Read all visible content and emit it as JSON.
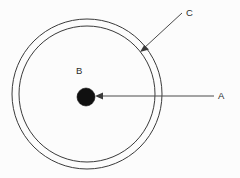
{
  "figure": {
    "background_color": "#fcfcfc",
    "stroke_color": "#3a3a3a",
    "dot_color": "#101010",
    "title": "",
    "labels": {
      "center_dot": "A",
      "interior_region": "B",
      "outer_ring": "C"
    },
    "geometry": {
      "center_x": 87,
      "center_y": 94,
      "outer_circle_radius": 75,
      "inner_circle_radius": 68,
      "center_dot_radius": 9
    },
    "annotations": [
      {
        "label": "A",
        "target": "center-dot",
        "leader_type": "arrow",
        "direction": "right-to-left",
        "label_x": 220,
        "label_y": 99
      },
      {
        "label": "B",
        "target": "interior-region",
        "leader_type": "none",
        "label_x": 77,
        "label_y": 74
      },
      {
        "label": "C",
        "target": "annulus-ring",
        "leader_type": "arrow",
        "direction": "upper-right-to-lower-left",
        "label_x": 187,
        "label_y": 16
      }
    ]
  }
}
